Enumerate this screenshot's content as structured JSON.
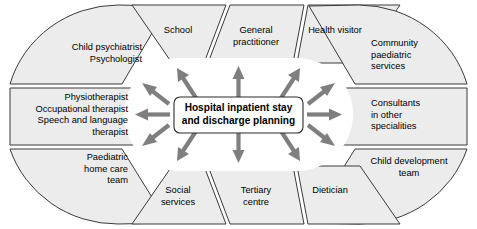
{
  "diagram": {
    "title": "Hospital inpatient stay and discharge planning",
    "center": {
      "label": "Hospital inpatient stay\nand discharge planning"
    },
    "colors": {
      "segment_fill": "#ececec",
      "segment_stroke": "#3a3a3a",
      "arrow": "#7f7f7f",
      "center_fill": "#ffffff",
      "center_stroke": "#2b2b2b",
      "background": "#ffffff",
      "text": "#000000"
    },
    "segments": [
      {
        "id": "child-psychiatrist-psychologist",
        "label": "Child psychiatrist\nPsychologist",
        "align": "right"
      },
      {
        "id": "school",
        "label": "School",
        "align": "center"
      },
      {
        "id": "general-practitioner",
        "label": "General\npractitioner",
        "align": "center"
      },
      {
        "id": "health-visitor",
        "label": "Health visitor",
        "align": "center"
      },
      {
        "id": "community-paediatric-services",
        "label": "Community\npaediatric\nservices",
        "align": "left"
      },
      {
        "id": "consultants-in-other-specialities",
        "label": "Consultants\nin other\nspecialities",
        "align": "left"
      },
      {
        "id": "child-development-team",
        "label": "Child development\nteam",
        "align": "center"
      },
      {
        "id": "dietician",
        "label": "Dietician",
        "align": "center"
      },
      {
        "id": "tertiary-centre",
        "label": "Tertiary\ncentre",
        "align": "center"
      },
      {
        "id": "social-services",
        "label": "Social\nservices",
        "align": "center"
      },
      {
        "id": "paediatric-home-care-team",
        "label": "Paediatric\nhome care\nteam",
        "align": "right"
      },
      {
        "id": "therapists",
        "label": "Physiotherapist\nOccupational therapist\nSpeech and language\ntherapist",
        "align": "right"
      }
    ],
    "arrow_count": 12
  }
}
